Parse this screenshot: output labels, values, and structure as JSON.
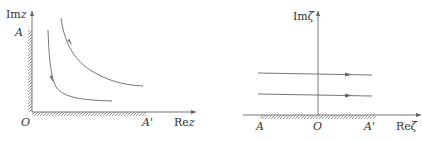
{
  "left_panel": {
    "name": "z-plane",
    "labels": {
      "imag_axis_prefix": "Im",
      "imag_axis_var": "z",
      "real_axis_prefix": "Re",
      "real_axis_var": "z",
      "point_a": "A",
      "origin": "O",
      "point_a_prime": "A'"
    },
    "boundary": "hatched walls along positive imaginary axis (O to A) and positive real axis (O to A')",
    "streamlines": 2,
    "streamline_shape": "hyperbolic, flowing from top toward right"
  },
  "right_panel": {
    "name": "zeta-plane",
    "labels": {
      "imag_axis_prefix": "Im",
      "imag_axis_var": "ζ",
      "real_axis_prefix": "Re",
      "real_axis_var": "ζ",
      "point_a": "A",
      "origin": "O",
      "point_a_prime": "A'"
    },
    "boundary": "hatched wall along real axis from A through O to A'",
    "streamlines": 2,
    "streamline_shape": "horizontal, flowing left to right"
  },
  "colors": {
    "line": "#666666",
    "text": "#333333",
    "background": "#ffffff"
  }
}
